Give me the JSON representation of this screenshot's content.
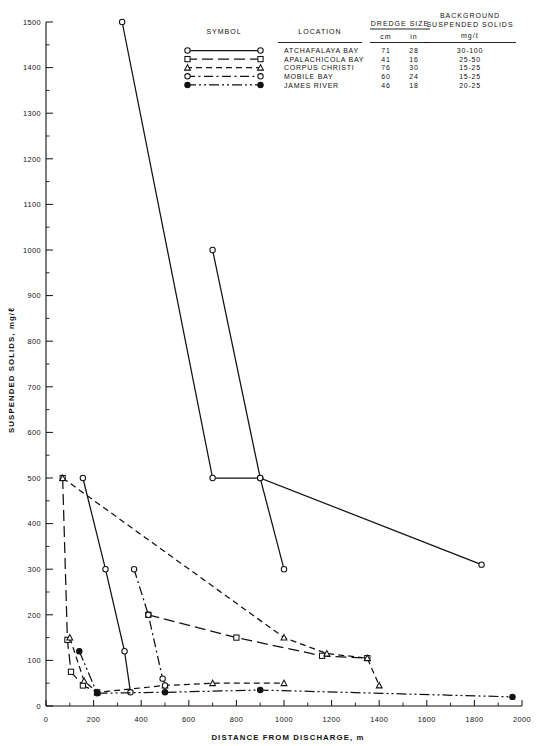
{
  "chart_data": {
    "type": "line",
    "title": "",
    "xlabel": "DISTANCE FROM DISCHARGE, m",
    "ylabel": "SUSPENDED SOLIDS, mg/ℓ",
    "xlim": [
      0,
      2000
    ],
    "ylim": [
      0,
      1500
    ],
    "xticks": [
      0,
      200,
      400,
      600,
      800,
      1000,
      1200,
      1400,
      1600,
      1800,
      2000
    ],
    "yticks": [
      0,
      100,
      200,
      300,
      400,
      500,
      600,
      700,
      800,
      900,
      1000,
      1100,
      1200,
      1300,
      1400,
      1500
    ],
    "grid": false,
    "legend_position": "top-right",
    "series": [
      {
        "name": "ATCHAFALAYA BAY",
        "marker": "circle-open",
        "linestyle": "solid",
        "points": [
          [
            320,
            1500
          ],
          [
            700,
            500
          ],
          [
            900,
            500
          ],
          [
            1000,
            300
          ]
        ]
      },
      {
        "name": "ATCHAFALAYA BAY (2)",
        "marker": "circle-open",
        "linestyle": "solid",
        "points": [
          [
            700,
            1000
          ],
          [
            900,
            500
          ],
          [
            1830,
            310
          ]
        ]
      },
      {
        "name": "ATCHAFALAYA BAY (3)",
        "marker": "circle-open",
        "linestyle": "solid",
        "points": [
          [
            155,
            500
          ],
          [
            250,
            300
          ],
          [
            330,
            120
          ],
          [
            355,
            30
          ]
        ]
      },
      {
        "name": "APALACHICOLA BAY",
        "marker": "square-open",
        "linestyle": "longdash",
        "points": [
          [
            70,
            500
          ],
          [
            90,
            145
          ],
          [
            105,
            75
          ],
          [
            155,
            45
          ],
          [
            215,
            30
          ]
        ]
      },
      {
        "name": "APALACHICOLA BAY (2)",
        "marker": "square-open",
        "linestyle": "longdash",
        "points": [
          [
            430,
            200
          ],
          [
            800,
            150
          ],
          [
            1160,
            110
          ],
          [
            1350,
            105
          ]
        ]
      },
      {
        "name": "CORPUS CHRISTI",
        "marker": "triangle-open",
        "linestyle": "dash",
        "points": [
          [
            70,
            500
          ],
          [
            1000,
            150
          ],
          [
            1180,
            115
          ],
          [
            1350,
            105
          ],
          [
            1400,
            45
          ]
        ]
      },
      {
        "name": "CORPUS CHRISTI (2)",
        "marker": "triangle-open",
        "linestyle": "dash",
        "points": [
          [
            100,
            150
          ],
          [
            160,
            55
          ],
          [
            215,
            30
          ],
          [
            500,
            45
          ],
          [
            700,
            50
          ],
          [
            1000,
            50
          ]
        ]
      },
      {
        "name": "MOBILE BAY",
        "marker": "circle-open",
        "linestyle": "dashdot",
        "points": [
          [
            370,
            300
          ],
          [
            430,
            200
          ],
          [
            490,
            60
          ],
          [
            500,
            45
          ]
        ]
      },
      {
        "name": "JAMES RIVER",
        "marker": "circle-solid",
        "linestyle": "dashdotdot",
        "points": [
          [
            140,
            120
          ],
          [
            215,
            28
          ],
          [
            500,
            30
          ],
          [
            900,
            35
          ],
          [
            1960,
            20
          ]
        ]
      }
    ]
  },
  "legend": {
    "headers": {
      "symbol": "SYMBOL",
      "location": "LOCATION",
      "dredge_size": "DREDGE SIZE",
      "dredge_cm": "cm",
      "dredge_in": "in",
      "background_line1": "BACKGROUND",
      "background_line2": "SUSPENDED SOLIDS",
      "background_units": "mg/ℓ"
    },
    "rows": [
      {
        "location": "ATCHAFALAYA BAY",
        "cm": "71",
        "in": "28",
        "background": "30-100",
        "marker": "circle-open",
        "linestyle": "solid"
      },
      {
        "location": "APALACHICOLA BAY",
        "cm": "41",
        "in": "16",
        "background": "25-50",
        "marker": "square-open",
        "linestyle": "longdash"
      },
      {
        "location": "CORPUS CHRISTI",
        "cm": "76",
        "in": "30",
        "background": "15-25",
        "marker": "triangle-open",
        "linestyle": "dash"
      },
      {
        "location": "MOBILE BAY",
        "cm": "60",
        "in": "24",
        "background": "15-25",
        "marker": "circle-open",
        "linestyle": "dashdot"
      },
      {
        "location": "JAMES RIVER",
        "cm": "46",
        "in": "18",
        "background": "20-25",
        "marker": "circle-solid",
        "linestyle": "dashdotdot"
      }
    ]
  },
  "axes": {
    "y_tick_labels": [
      "1500",
      "1400",
      "1300",
      "1200",
      "1100",
      "1000",
      "900",
      "800",
      "700",
      "600",
      "500",
      "400",
      "300",
      "200",
      "100",
      "0"
    ],
    "x_tick_labels": [
      "0",
      "200",
      "400",
      "600",
      "800",
      "1000",
      "1200",
      "1400",
      "1600",
      "1800",
      "2000"
    ],
    "x_title": "DISTANCE FROM DISCHARGE, m",
    "y_title": "SUSPENDED SOLIDS, mg/ℓ"
  },
  "colors": {
    "ink": "#111111",
    "paper": "#ffffff"
  }
}
